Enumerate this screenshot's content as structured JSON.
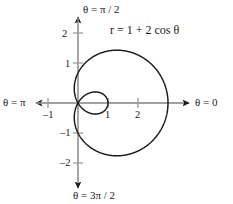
{
  "figure": {
    "axis_color": "#9b9b9b",
    "curve_color": "#1a1a1a",
    "arrow_color": "#1a1a1a",
    "background": "#ffffff"
  },
  "labels": {
    "theta_half": "θ = π / 2",
    "theta_three_half": "θ = 3π / 2",
    "theta_pi": "θ = π",
    "theta_zero": "θ = 0",
    "equation": "r = 1 + 2 cos θ"
  },
  "ticks": {
    "y2": "2",
    "y1": "1",
    "ym1": "–1",
    "ym2": "–2",
    "xm1": "–1",
    "x1": "1",
    "x2": "2"
  },
  "chart_data": {
    "type": "line",
    "plot_kind": "polar",
    "title": "",
    "equation": "r = 1 + 2 cos θ",
    "curve_name": "limaçon with inner loop",
    "parameters": {
      "a": 1,
      "b": 2
    },
    "xlabel": "θ = 0",
    "ylabel": "θ = π / 2",
    "xlim": [
      -1.6,
      3.6
    ],
    "ylim": [
      -2.6,
      2.6
    ],
    "xticks": [
      -1,
      1,
      2
    ],
    "yticks": [
      -2,
      -1,
      1,
      2
    ],
    "xticklabels": [
      "–1",
      "1",
      "2"
    ],
    "yticklabels": [
      "–2",
      "–1",
      "1",
      "2"
    ],
    "grid": false,
    "legend": false,
    "axis_arrows": [
      "θ = 0",
      "θ = π / 2",
      "θ = π",
      "θ = 3π / 2"
    ],
    "annotations": [
      {
        "text": "r = 1 + 2 cos θ",
        "x": 1.1,
        "y": 2.4
      }
    ],
    "units_per_pixel": 0.0333,
    "origin_px": [
      78,
      103
    ],
    "key_points": [
      {
        "theta_deg": 0,
        "r": 3,
        "x": 3,
        "y": 0
      },
      {
        "theta_deg": 60,
        "r": 2,
        "x": 1,
        "y": 1.732
      },
      {
        "theta_deg": 90,
        "r": 1,
        "x": 0,
        "y": 1
      },
      {
        "theta_deg": 120,
        "r": 0,
        "x": 0,
        "y": 0
      },
      {
        "theta_deg": 180,
        "r": -1,
        "x": 1,
        "y": 0
      },
      {
        "theta_deg": 240,
        "r": 0,
        "x": 0,
        "y": 0
      },
      {
        "theta_deg": 270,
        "r": 1,
        "x": 0,
        "y": -1
      },
      {
        "theta_deg": 300,
        "r": 2,
        "x": 1,
        "y": -1.732
      },
      {
        "theta_deg": 360,
        "r": 3,
        "x": 3,
        "y": 0
      }
    ],
    "series": [
      {
        "name": "r = 1 + 2 cos θ",
        "theta_deg": [
          0,
          10,
          20,
          30,
          40,
          50,
          60,
          70,
          80,
          90,
          100,
          110,
          120,
          130,
          140,
          150,
          160,
          170,
          180,
          190,
          200,
          210,
          220,
          230,
          240,
          250,
          260,
          270,
          280,
          290,
          300,
          310,
          320,
          330,
          340,
          350,
          360
        ],
        "r": [
          3.0,
          2.97,
          2.879,
          2.732,
          2.532,
          2.286,
          2.0,
          1.684,
          1.347,
          1.0,
          0.653,
          0.316,
          0.0,
          -0.286,
          -0.532,
          -0.732,
          -0.879,
          -0.97,
          -1.0,
          -0.97,
          -0.879,
          -0.732,
          -0.532,
          -0.286,
          0.0,
          0.316,
          0.653,
          1.0,
          1.347,
          1.684,
          2.0,
          2.286,
          2.532,
          2.732,
          2.879,
          2.97,
          3.0
        ]
      }
    ]
  }
}
